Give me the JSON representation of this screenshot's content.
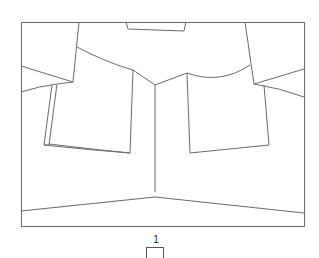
{
  "diagram": {
    "type": "line-sketch",
    "stroke_color": "#666666",
    "background": "#ffffff"
  },
  "footer": {
    "page_number": "1"
  }
}
